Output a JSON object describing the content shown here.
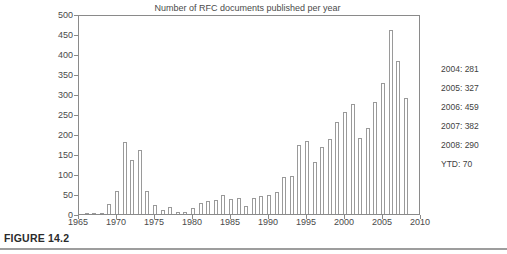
{
  "figure": {
    "caption": "FIGURE 14.2"
  },
  "annotations": [
    "2004: 281",
    "2005: 327",
    "2006: 459",
    "2007: 382",
    "2008: 290",
    "YTD: 70"
  ],
  "chart_data": {
    "type": "bar",
    "title": "Number of RFC documents published per year",
    "xlabel": "",
    "ylabel": "",
    "xlim": [
      1965,
      2010
    ],
    "ylim": [
      0,
      500
    ],
    "ytick_step": 50,
    "xtick_step": 5,
    "y_ticks": [
      0,
      50,
      100,
      150,
      200,
      250,
      300,
      350,
      400,
      450,
      500
    ],
    "x_ticks": [
      1965,
      1970,
      1975,
      1980,
      1985,
      1990,
      1995,
      2000,
      2005,
      2010
    ],
    "grid": false,
    "legend": "none",
    "bar_color": "#ffffff",
    "bar_edge_color": "#9a9a9a",
    "axis_color": "#8a8a8a",
    "categories": [
      1966,
      1967,
      1968,
      1969,
      1970,
      1971,
      1972,
      1973,
      1974,
      1975,
      1976,
      1977,
      1978,
      1979,
      1980,
      1981,
      1982,
      1983,
      1984,
      1985,
      1986,
      1987,
      1988,
      1989,
      1990,
      1991,
      1992,
      1993,
      1994,
      1995,
      1996,
      1997,
      1998,
      1999,
      2000,
      2001,
      2002,
      2003,
      2004,
      2005,
      2006,
      2007,
      2008
    ],
    "values": [
      1,
      2,
      2,
      25,
      57,
      181,
      134,
      160,
      57,
      23,
      9,
      18,
      5,
      4,
      14,
      28,
      32,
      35,
      47,
      37,
      41,
      21,
      40,
      44,
      48,
      55,
      93,
      94,
      172,
      182,
      130,
      167,
      188,
      231,
      255,
      276,
      190,
      216,
      281,
      327,
      459,
      382,
      290
    ]
  }
}
